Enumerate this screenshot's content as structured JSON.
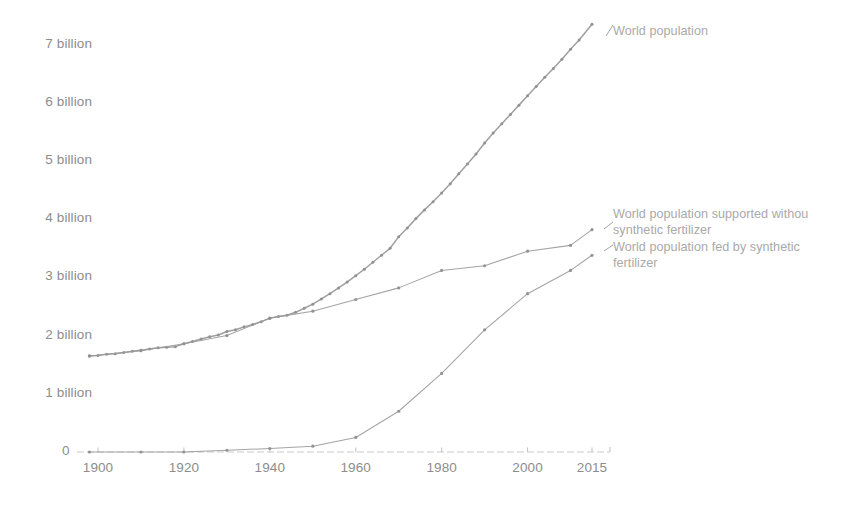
{
  "chart_data": {
    "type": "line",
    "title": "",
    "subtitle": "",
    "xlabel": "",
    "ylabel": "",
    "xlim": [
      1898,
      2015
    ],
    "ylim": [
      0,
      7.6
    ],
    "grid": false,
    "legend_position": "inline-right",
    "y_tick_labels": [
      "7 billion",
      "6 billion",
      "5 billion",
      "4 billion",
      "3 billion",
      "2 billion",
      "1 billion",
      "0"
    ],
    "y_tick_values": [
      7,
      6,
      5,
      4,
      3,
      2,
      1,
      0
    ],
    "x_tick_labels": [
      "1900",
      "1920",
      "1940",
      "1960",
      "1980",
      "2000",
      "2015"
    ],
    "x_tick_values": [
      1900,
      1920,
      1940,
      1960,
      1980,
      2000,
      2015
    ],
    "series": [
      {
        "name": "World population",
        "label_lines": [
          "World population"
        ],
        "color": "#9a9a9a",
        "marker": "dense-dot",
        "x": [
          1898,
          1900,
          1902,
          1904,
          1906,
          1908,
          1910,
          1912,
          1914,
          1916,
          1918,
          1920,
          1922,
          1924,
          1926,
          1928,
          1930,
          1932,
          1934,
          1936,
          1938,
          1940,
          1942,
          1944,
          1946,
          1948,
          1950,
          1952,
          1954,
          1956,
          1958,
          1960,
          1962,
          1964,
          1966,
          1968,
          1970,
          1972,
          1974,
          1976,
          1978,
          1980,
          1982,
          1984,
          1986,
          1988,
          1990,
          1992,
          1994,
          1996,
          1998,
          2000,
          2002,
          2004,
          2006,
          2008,
          2010,
          2012,
          2015
        ],
        "y": [
          1.65,
          1.66,
          1.68,
          1.69,
          1.71,
          1.73,
          1.75,
          1.77,
          1.79,
          1.8,
          1.81,
          1.86,
          1.9,
          1.94,
          1.98,
          2.01,
          2.07,
          2.1,
          2.15,
          2.19,
          2.24,
          2.3,
          2.33,
          2.35,
          2.4,
          2.47,
          2.54,
          2.63,
          2.72,
          2.82,
          2.92,
          3.03,
          3.14,
          3.26,
          3.38,
          3.5,
          3.7,
          3.85,
          4.01,
          4.16,
          4.3,
          4.45,
          4.61,
          4.78,
          4.95,
          5.12,
          5.31,
          5.48,
          5.64,
          5.8,
          5.96,
          6.12,
          6.28,
          6.44,
          6.59,
          6.75,
          6.92,
          7.08,
          7.35
        ]
      },
      {
        "name": "World population supported without synthetic fertilizer",
        "label_lines": [
          "World population supported withou",
          "synthetic fertilizer"
        ],
        "color": "#9a9a9a",
        "marker": "dot",
        "x": [
          1898,
          1910,
          1920,
          1930,
          1940,
          1950,
          1960,
          1970,
          1980,
          1990,
          2000,
          2010,
          2015
        ],
        "y": [
          1.65,
          1.74,
          1.86,
          2.0,
          2.3,
          2.42,
          2.62,
          2.82,
          3.12,
          3.2,
          3.45,
          3.55,
          3.82
        ]
      },
      {
        "name": "World population fed by synthetic fertilizer",
        "label_lines": [
          "World population fed by synthetic",
          "fertilizer"
        ],
        "color": "#9a9a9a",
        "marker": "dot",
        "x": [
          1898,
          1910,
          1920,
          1930,
          1940,
          1950,
          1960,
          1970,
          1980,
          1990,
          2000,
          2010,
          2015
        ],
        "y": [
          0.0,
          0.0,
          0.0,
          0.03,
          0.06,
          0.1,
          0.25,
          0.7,
          1.35,
          2.1,
          2.72,
          3.12,
          3.38
        ]
      }
    ],
    "axis_color": "#b9b9b9",
    "line_color": "#9a9a9a",
    "text_color": "#8d8d8d",
    "background": "#ffffff"
  }
}
